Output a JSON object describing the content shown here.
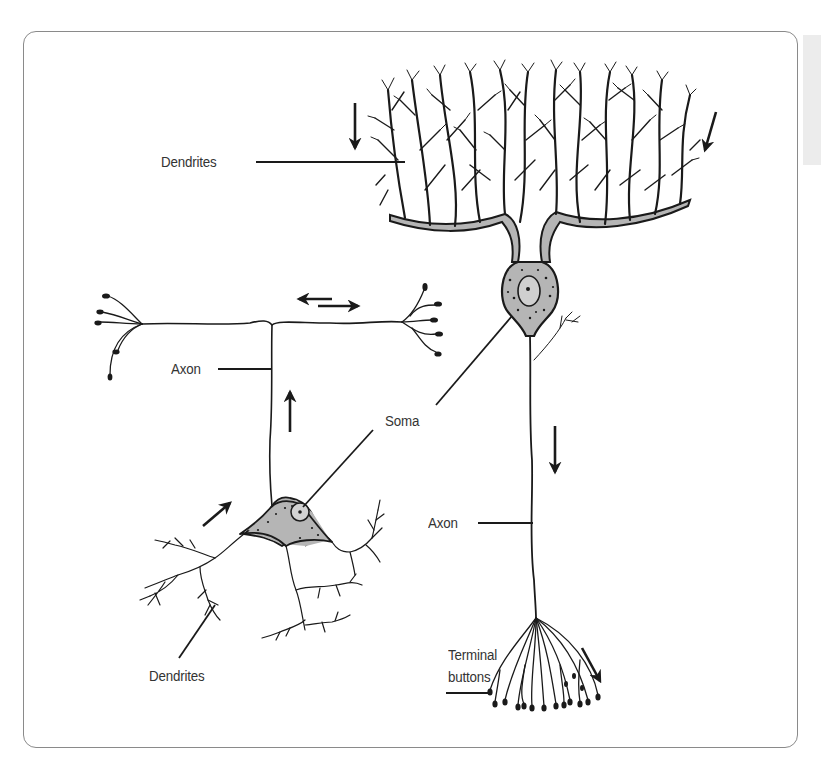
{
  "figure": {
    "colors": {
      "ink": "#1a1a1a",
      "soma_fill": "#b5b5b5",
      "frame": "#8a8a8a",
      "label_text": "#333333",
      "side_strip": "#ececec"
    }
  },
  "labels": {
    "dendrites_top": "Dendrites",
    "axon_left": "Axon",
    "soma": "Soma",
    "axon_right": "Axon",
    "dendrites_bottom": "Dendrites",
    "terminal_line1": "Terminal",
    "terminal_line2": "buttons"
  },
  "arrows": [
    {
      "id": "dendrite-top-left",
      "direction": "down"
    },
    {
      "id": "dendrite-top-right",
      "direction": "down-left"
    },
    {
      "id": "axon-branch-left",
      "direction": "left"
    },
    {
      "id": "axon-branch-right",
      "direction": "right"
    },
    {
      "id": "axon-left-up",
      "direction": "up"
    },
    {
      "id": "dendrite-left-in",
      "direction": "up-right"
    },
    {
      "id": "axon-right-down",
      "direction": "down"
    },
    {
      "id": "terminal-down-right",
      "direction": "down-right"
    }
  ]
}
